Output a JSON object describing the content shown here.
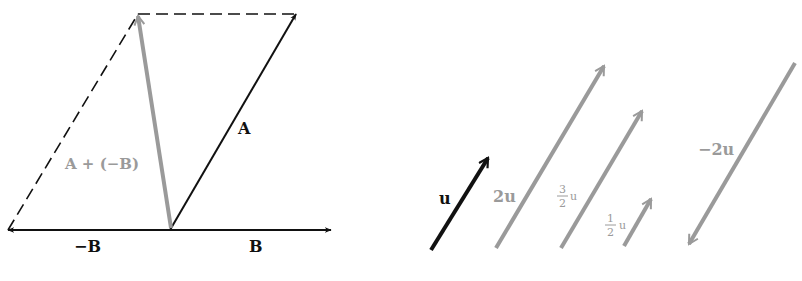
{
  "figure": {
    "left_panel": {
      "title": "Vector subtraction A − B as A + (−B)",
      "vectors": {
        "A": {
          "label": "A",
          "color": "#111111"
        },
        "B": {
          "label": "B",
          "color": "#111111"
        },
        "neg_B": {
          "label": "−B",
          "color": "#111111"
        },
        "A_plus_neg_B": {
          "label": "A + (−B)",
          "color": "#9a9a9a"
        }
      },
      "construction_lines": "dashed"
    },
    "right_panel": {
      "title": "Scalar multiples of u",
      "vectors": {
        "u": {
          "label": "u",
          "scalar": 1,
          "color": "#111111"
        },
        "two_u": {
          "label": "2u",
          "scalar": 2,
          "color": "#9a9a9a"
        },
        "three_halves_u": {
          "num": "3",
          "den": "2",
          "var": "u",
          "scalar": 1.5,
          "color": "#9a9a9a"
        },
        "half_u": {
          "num": "1",
          "den": "2",
          "var": "u",
          "scalar": 0.5,
          "color": "#9a9a9a"
        },
        "neg_two_u": {
          "label": "−2u",
          "scalar": -2,
          "color": "#9a9a9a"
        }
      }
    }
  }
}
